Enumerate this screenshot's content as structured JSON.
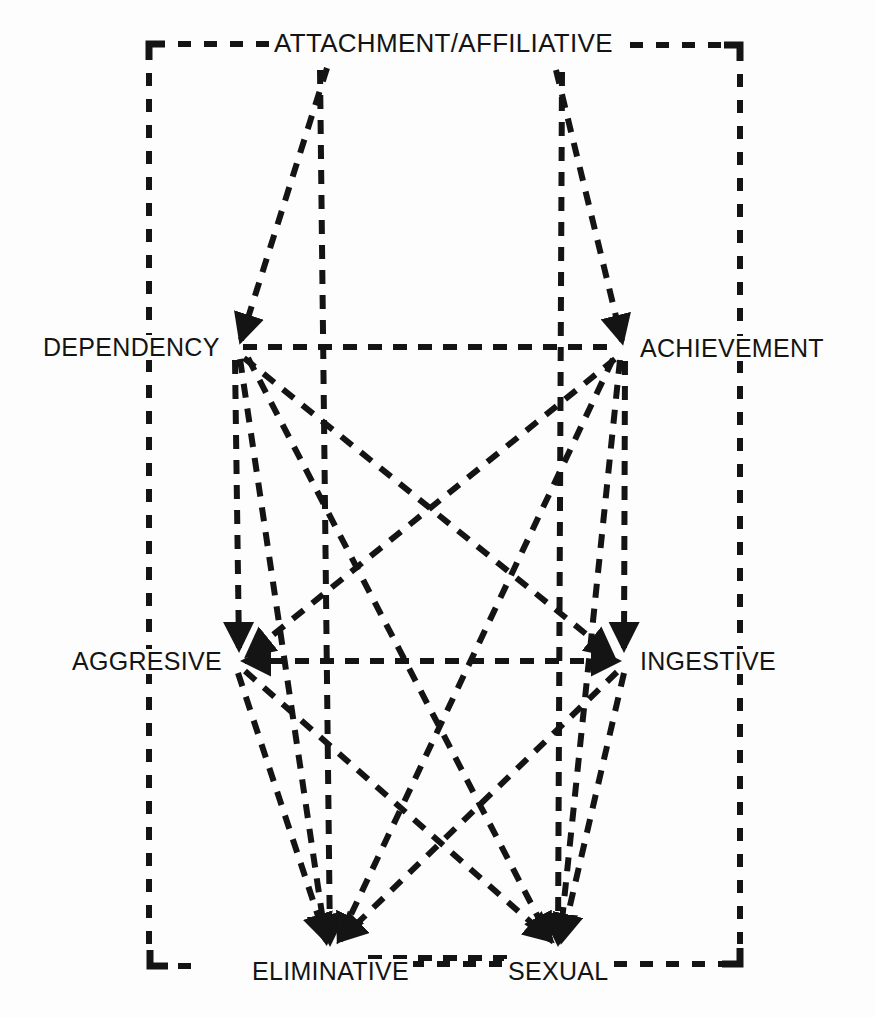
{
  "figure": {
    "title_visible": false,
    "background_color": "#fdfdfd",
    "line_color": "#141414",
    "text_color": "#141414",
    "width": 875,
    "height": 1017
  },
  "nodes": [
    {
      "id": "attachment",
      "label": "ATTACHMENT/AFFILIATIVE",
      "x": 443,
      "y": 43,
      "anchor": "center",
      "row": "top"
    },
    {
      "id": "dependency",
      "label": "DEPENDENCY",
      "x": 232,
      "y": 347,
      "anchor": "right",
      "row": "upper"
    },
    {
      "id": "achievement",
      "label": "ACHIEVEMENT",
      "x": 628,
      "y": 348,
      "anchor": "left",
      "row": "upper"
    },
    {
      "id": "aggresive",
      "label": "AGGRESIVE",
      "x": 232,
      "y": 661,
      "anchor": "right",
      "row": "middle"
    },
    {
      "id": "ingestive",
      "label": "INGESTIVE",
      "x": 630,
      "y": 661,
      "anchor": "left",
      "row": "middle"
    },
    {
      "id": "eliminative",
      "label": "ELIMINATIVE",
      "x": 330,
      "y": 955,
      "anchor": "center",
      "row": "bottom"
    },
    {
      "id": "sexual",
      "label": "SEXUAL",
      "x": 558,
      "y": 955,
      "anchor": "center",
      "row": "bottom"
    }
  ],
  "frame": {
    "name": "outer-dashed-frame",
    "left": 149,
    "top": 44,
    "right": 740,
    "bottom": 966,
    "style": "dashed",
    "description": "dashed rectangle border passing behind the ATTACHMENT/AFFILIATIVE, ELIMINATIVE and SEXUAL labels"
  },
  "edges": [
    {
      "from": "dependency",
      "to": "achievement",
      "arrow": "none",
      "style": "dashed",
      "name": "edge-dependency-achievement"
    },
    {
      "from": "aggresive",
      "to": "ingestive",
      "arrow": "both",
      "style": "dashed",
      "name": "edge-aggresive-ingestive"
    },
    {
      "from": "attachment",
      "to": "dependency",
      "arrow": "end",
      "style": "dashed",
      "name": "edge-attachment-dependency"
    },
    {
      "from": "attachment",
      "to": "achievement",
      "arrow": "end",
      "style": "dashed",
      "name": "edge-attachment-achievement"
    },
    {
      "from": "attachment",
      "to": "eliminative",
      "arrow": "end",
      "style": "dashed",
      "name": "edge-attachment-eliminative"
    },
    {
      "from": "attachment",
      "to": "sexual",
      "arrow": "end",
      "style": "dashed",
      "name": "edge-attachment-sexual"
    },
    {
      "from": "dependency",
      "to": "aggresive",
      "arrow": "end",
      "style": "dashed",
      "name": "edge-dependency-aggresive"
    },
    {
      "from": "dependency",
      "to": "eliminative",
      "arrow": "end",
      "style": "dashed",
      "name": "edge-dependency-eliminative"
    },
    {
      "from": "dependency",
      "to": "sexual",
      "arrow": "end",
      "style": "dashed",
      "name": "edge-dependency-sexual"
    },
    {
      "from": "dependency",
      "to": "ingestive",
      "arrow": "end",
      "style": "dashed",
      "name": "edge-dependency-ingestive"
    },
    {
      "from": "achievement",
      "to": "ingestive",
      "arrow": "end",
      "style": "dashed",
      "name": "edge-achievement-ingestive"
    },
    {
      "from": "achievement",
      "to": "aggresive",
      "arrow": "end",
      "style": "dashed",
      "name": "edge-achievement-aggresive"
    },
    {
      "from": "achievement",
      "to": "eliminative",
      "arrow": "end",
      "style": "dashed",
      "name": "edge-achievement-eliminative"
    },
    {
      "from": "achievement",
      "to": "sexual",
      "arrow": "end",
      "style": "dashed",
      "name": "edge-achievement-sexual"
    },
    {
      "from": "aggresive",
      "to": "eliminative",
      "arrow": "end",
      "style": "dashed",
      "name": "edge-aggresive-eliminative"
    },
    {
      "from": "aggresive",
      "to": "sexual",
      "arrow": "end",
      "style": "dashed",
      "name": "edge-aggresive-sexual"
    },
    {
      "from": "ingestive",
      "to": "eliminative",
      "arrow": "end",
      "style": "dashed",
      "name": "edge-ingestive-eliminative"
    },
    {
      "from": "ingestive",
      "to": "sexual",
      "arrow": "end",
      "style": "dashed",
      "name": "edge-ingestive-sexual"
    },
    {
      "from": "eliminative",
      "to": "sexual",
      "arrow": "none",
      "style": "dashed",
      "name": "edge-eliminative-sexual"
    }
  ]
}
